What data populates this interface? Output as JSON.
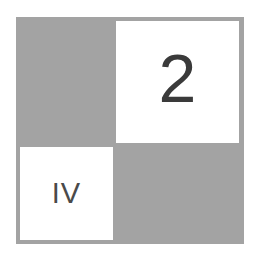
{
  "diagram": {
    "grid": "2x2",
    "colors": {
      "shaded": "#a3a3a3",
      "unshaded": "#ffffff",
      "text": "#3a3a3a"
    },
    "cells": [
      {
        "position": "top-left",
        "shaded": true,
        "label": ""
      },
      {
        "position": "top-right",
        "shaded": false,
        "label": "2"
      },
      {
        "position": "bottom-left",
        "shaded": false,
        "label": "IV"
      },
      {
        "position": "bottom-right",
        "shaded": true,
        "label": ""
      }
    ]
  }
}
